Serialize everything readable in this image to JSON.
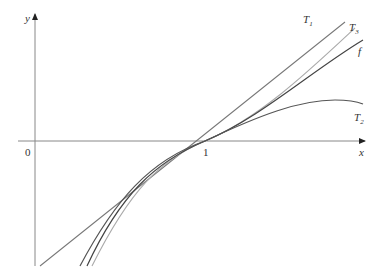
{
  "figure": {
    "axes": {
      "x_label": "x",
      "y_label": "y",
      "origin_label": "0",
      "tick_label": "1"
    },
    "curves": [
      {
        "id": "T1",
        "label": "T",
        "sub": "1",
        "color": "#777777"
      },
      {
        "id": "T3",
        "label": "T",
        "sub": "3",
        "color": "#aaaaaa"
      },
      {
        "id": "f",
        "label": "f",
        "sub": "",
        "color": "#444444"
      },
      {
        "id": "T2",
        "label": "T",
        "sub": "2",
        "color": "#555555"
      }
    ]
  }
}
